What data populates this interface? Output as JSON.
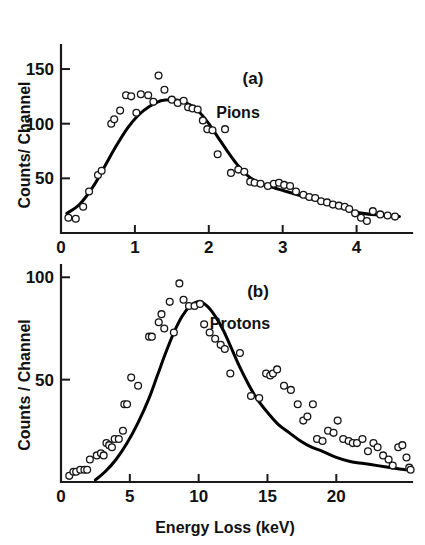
{
  "figure": {
    "background": "#ffffff",
    "ink_color": "#111111",
    "marker_style": "open-circle",
    "panel_count": 2
  },
  "chart_data": [
    {
      "type": "scatter",
      "panel": "a",
      "panel_tag": "(a)",
      "title": "Pions",
      "xlabel": "",
      "ylabel": "Counts/ Channel",
      "xlim": [
        0,
        4.75
      ],
      "ylim": [
        0,
        172
      ],
      "xticks": [
        0,
        1,
        2,
        3,
        4
      ],
      "xticklabels": [
        "0",
        "1",
        "2",
        "3",
        "4"
      ],
      "yticks": [
        50,
        100,
        150
      ],
      "yticklabels": [
        "50",
        "100",
        "150"
      ],
      "grid": false,
      "legend": "none",
      "series": [
        {
          "name": "Pions data",
          "marker": "open-circle",
          "points": [
            [
              0.1,
              14
            ],
            [
              0.2,
              13
            ],
            [
              0.3,
              24
            ],
            [
              0.38,
              38
            ],
            [
              0.5,
              53
            ],
            [
              0.55,
              57
            ],
            [
              0.68,
              100
            ],
            [
              0.72,
              104
            ],
            [
              0.8,
              112
            ],
            [
              0.88,
              126
            ],
            [
              0.95,
              125
            ],
            [
              1.02,
              110
            ],
            [
              1.08,
              127
            ],
            [
              1.18,
              126
            ],
            [
              1.25,
              120
            ],
            [
              1.32,
              144
            ],
            [
              1.4,
              131
            ],
            [
              1.5,
              122
            ],
            [
              1.58,
              119
            ],
            [
              1.66,
              121
            ],
            [
              1.72,
              115
            ],
            [
              1.78,
              114
            ],
            [
              1.85,
              113
            ],
            [
              1.92,
              103
            ],
            [
              1.98,
              95
            ],
            [
              2.05,
              94
            ],
            [
              2.12,
              72
            ],
            [
              2.22,
              95
            ],
            [
              2.3,
              55
            ],
            [
              2.4,
              58
            ],
            [
              2.48,
              56
            ],
            [
              2.56,
              47
            ],
            [
              2.62,
              46
            ],
            [
              2.7,
              45
            ],
            [
              2.8,
              43
            ],
            [
              2.88,
              45
            ],
            [
              2.95,
              46
            ],
            [
              3.02,
              44
            ],
            [
              3.1,
              43
            ],
            [
              3.18,
              38
            ],
            [
              3.28,
              35
            ],
            [
              3.36,
              33
            ],
            [
              3.44,
              32
            ],
            [
              3.52,
              29
            ],
            [
              3.6,
              28
            ],
            [
              3.68,
              26
            ],
            [
              3.76,
              25
            ],
            [
              3.84,
              24
            ],
            [
              3.9,
              22
            ],
            [
              3.98,
              18
            ],
            [
              4.06,
              14
            ],
            [
              4.14,
              11
            ],
            [
              4.22,
              20
            ],
            [
              4.32,
              17
            ],
            [
              4.42,
              16
            ],
            [
              4.52,
              15
            ]
          ]
        }
      ],
      "fit_curve": {
        "name": "fitted distribution",
        "points": [
          [
            0.08,
            18
          ],
          [
            0.25,
            26
          ],
          [
            0.45,
            44
          ],
          [
            0.6,
            62
          ],
          [
            0.75,
            80
          ],
          [
            0.9,
            96
          ],
          [
            1.05,
            108
          ],
          [
            1.2,
            116
          ],
          [
            1.35,
            121
          ],
          [
            1.5,
            122
          ],
          [
            1.62,
            121
          ],
          [
            1.75,
            117
          ],
          [
            1.88,
            110
          ],
          [
            2.0,
            100
          ],
          [
            2.12,
            88
          ],
          [
            2.25,
            75
          ],
          [
            2.38,
            63
          ],
          [
            2.5,
            54
          ],
          [
            2.62,
            48
          ],
          [
            2.75,
            44
          ],
          [
            2.9,
            41
          ],
          [
            3.05,
            38
          ],
          [
            3.2,
            35
          ],
          [
            3.4,
            31
          ],
          [
            3.6,
            27
          ],
          [
            3.8,
            23
          ],
          [
            4.0,
            19
          ],
          [
            4.2,
            17
          ],
          [
            4.4,
            16
          ],
          [
            4.58,
            15
          ]
        ]
      }
    },
    {
      "type": "scatter",
      "panel": "b",
      "panel_tag": "(b)",
      "title": "Protons",
      "xlabel": "Energy Loss   (keV)",
      "ylabel": "Counts / Channel",
      "xlim": [
        0,
        25.5
      ],
      "ylim": [
        0,
        106
      ],
      "xticks": [
        0,
        5,
        10,
        15,
        20
      ],
      "xticklabels": [
        "0",
        "5",
        "10",
        "15",
        "20"
      ],
      "yticks": [
        50,
        100
      ],
      "yticklabels": [
        "50",
        "100"
      ],
      "grid": false,
      "legend": "none",
      "series": [
        {
          "name": "Protons data",
          "marker": "open-circle",
          "points": [
            [
              0.6,
              3
            ],
            [
              0.9,
              5
            ],
            [
              1.1,
              5
            ],
            [
              1.4,
              6
            ],
            [
              1.7,
              6
            ],
            [
              1.9,
              6
            ],
            [
              2.1,
              11
            ],
            [
              2.6,
              13
            ],
            [
              2.9,
              14
            ],
            [
              3.1,
              13
            ],
            [
              3.3,
              19
            ],
            [
              3.5,
              18
            ],
            [
              3.7,
              17
            ],
            [
              3.9,
              21
            ],
            [
              4.2,
              21
            ],
            [
              4.5,
              25
            ],
            [
              4.6,
              38
            ],
            [
              4.8,
              38
            ],
            [
              5.1,
              51
            ],
            [
              5.6,
              47
            ],
            [
              6.4,
              71
            ],
            [
              6.6,
              71
            ],
            [
              7.1,
              78
            ],
            [
              7.3,
              82
            ],
            [
              7.5,
              75
            ],
            [
              7.9,
              88
            ],
            [
              8.2,
              73
            ],
            [
              8.6,
              97
            ],
            [
              8.9,
              89
            ],
            [
              9.3,
              86
            ],
            [
              9.7,
              86
            ],
            [
              10.1,
              87
            ],
            [
              10.4,
              77
            ],
            [
              10.8,
              73
            ],
            [
              11.2,
              70
            ],
            [
              11.6,
              67
            ],
            [
              11.9,
              65
            ],
            [
              12.3,
              53
            ],
            [
              13.0,
              63
            ],
            [
              13.8,
              42
            ],
            [
              14.4,
              41
            ],
            [
              14.9,
              53
            ],
            [
              15.2,
              52
            ],
            [
              15.4,
              53
            ],
            [
              15.7,
              55
            ],
            [
              16.2,
              47
            ],
            [
              16.7,
              45
            ],
            [
              17.2,
              38
            ],
            [
              17.6,
              30
            ],
            [
              17.9,
              32
            ],
            [
              18.3,
              38
            ],
            [
              18.6,
              21
            ],
            [
              19.0,
              20
            ],
            [
              19.4,
              25
            ],
            [
              19.8,
              24
            ],
            [
              20.1,
              30
            ],
            [
              20.5,
              21
            ],
            [
              20.9,
              20
            ],
            [
              21.2,
              19
            ],
            [
              21.5,
              19
            ],
            [
              21.9,
              21
            ],
            [
              22.3,
              15
            ],
            [
              22.7,
              19
            ],
            [
              23.0,
              17
            ],
            [
              23.4,
              13
            ],
            [
              23.8,
              11
            ],
            [
              24.1,
              8
            ],
            [
              24.5,
              17
            ],
            [
              24.8,
              18
            ],
            [
              25.1,
              12
            ],
            [
              25.3,
              7
            ],
            [
              25.4,
              6
            ]
          ]
        }
      ],
      "fit_curve": {
        "name": "fitted distribution",
        "points": [
          [
            2.5,
            1
          ],
          [
            3.2,
            5
          ],
          [
            4.0,
            11
          ],
          [
            4.8,
            19
          ],
          [
            5.6,
            29
          ],
          [
            6.4,
            41
          ],
          [
            7.0,
            52
          ],
          [
            7.6,
            63
          ],
          [
            8.2,
            73
          ],
          [
            8.8,
            81
          ],
          [
            9.4,
            86
          ],
          [
            10.0,
            88
          ],
          [
            10.6,
            86
          ],
          [
            11.2,
            81
          ],
          [
            11.8,
            74
          ],
          [
            12.4,
            65
          ],
          [
            13.0,
            56
          ],
          [
            13.6,
            48
          ],
          [
            14.2,
            41
          ],
          [
            15.0,
            34
          ],
          [
            15.8,
            28
          ],
          [
            16.6,
            24
          ],
          [
            17.4,
            20
          ],
          [
            18.2,
            17
          ],
          [
            19.0,
            15
          ],
          [
            20.0,
            12
          ],
          [
            21.0,
            10
          ],
          [
            22.0,
            9
          ],
          [
            23.0,
            8
          ],
          [
            24.0,
            7
          ],
          [
            25.0,
            6
          ],
          [
            25.4,
            6
          ]
        ]
      }
    }
  ]
}
